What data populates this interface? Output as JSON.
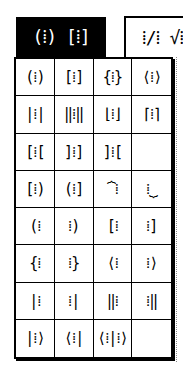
{
  "tabs": [
    {
      "label": "(⁞) [⁞]",
      "active": true,
      "name": "fences-templates"
    },
    {
      "label": "⁞/⁞ √⁞",
      "active": false,
      "name": "fraction-radical-templates"
    }
  ],
  "palette": {
    "cells": [
      "(⁞)",
      "[⁞]",
      "{⁞}",
      "⟨⁞⟩",
      "|⁞|",
      "‖⁞‖",
      "⌊⁞⌋",
      "⌈⁞⌉",
      "[⁞[",
      "]⁞]",
      "]⁞[",
      "",
      "[⁞)",
      "(⁞]",
      "⏞⁞",
      "⁞⏟",
      "(⁞ ",
      " ⁞)",
      "[⁞ ",
      " ⁞]",
      "{⁞ ",
      " ⁞}",
      "⟨⁞ ",
      " ⁞⟩",
      "|⁞ ",
      " ⁞|",
      "‖⁞ ",
      " ⁞‖",
      "|⁞⟩",
      "⟨⁞|",
      "⟨⁞|⁞⟩",
      ""
    ],
    "cell_names": [
      "parentheses",
      "square-brackets",
      "curly-braces",
      "angle-brackets",
      "absolute-value",
      "double-bars",
      "floor",
      "ceiling",
      "left-bracket-open",
      "right-bracket-open",
      "reversed-brackets",
      "empty",
      "bracket-paren",
      "paren-bracket",
      "overbrace",
      "underbrace",
      "left-paren-only",
      "right-paren-only",
      "left-bracket-only",
      "right-bracket-only",
      "left-brace-only",
      "right-brace-only",
      "left-angle-only",
      "right-angle-only",
      "left-bar-only",
      "right-bar-only",
      "left-double-bar-only",
      "right-double-bar-only",
      "ket",
      "bra",
      "bra-ket",
      "empty"
    ]
  }
}
